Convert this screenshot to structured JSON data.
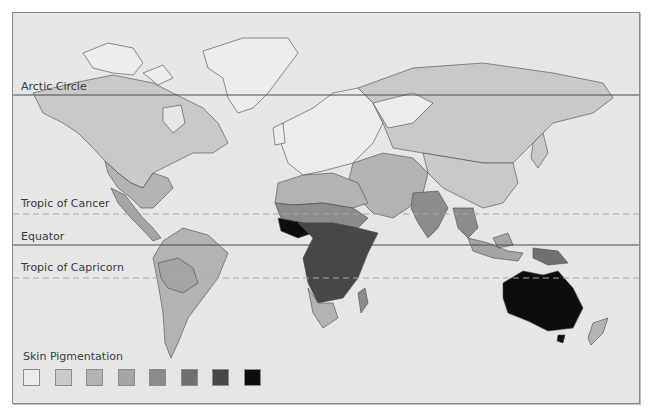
{
  "map": {
    "title": "Skin Pigmentation",
    "background": "#e6e6e6",
    "border_color": "#8a8a8a",
    "lines": [
      {
        "id": "arctic",
        "label": "Arctic Circle",
        "y": 82,
        "style": "solid"
      },
      {
        "id": "cancer",
        "label": "Tropic of Cancer",
        "y": 201,
        "style": "dashed"
      },
      {
        "id": "equator",
        "label": "Equator",
        "y": 232,
        "style": "solid"
      },
      {
        "id": "capricorn",
        "label": "Tropic of Capricorn",
        "y": 265,
        "style": "dashed"
      }
    ],
    "legend": {
      "title": "Skin Pigmentation",
      "levels": [
        {
          "level": 1,
          "color": "#ececec"
        },
        {
          "level": 2,
          "color": "#c9c9c9"
        },
        {
          "level": 3,
          "color": "#b3b3b3"
        },
        {
          "level": 4,
          "color": "#a5a5a5"
        },
        {
          "level": 5,
          "color": "#8c8c8c"
        },
        {
          "level": 6,
          "color": "#707070"
        },
        {
          "level": 7,
          "color": "#474747"
        },
        {
          "level": 8,
          "color": "#0d0d0d"
        }
      ]
    },
    "regions": [
      {
        "name": "Greenland",
        "level": 1
      },
      {
        "name": "Canadian Arctic",
        "level": 1
      },
      {
        "name": "North America north",
        "level": 2
      },
      {
        "name": "North America south",
        "level": 3
      },
      {
        "name": "Mexico",
        "level": 4
      },
      {
        "name": "Central America",
        "level": 4
      },
      {
        "name": "South America",
        "level": 3
      },
      {
        "name": "South America Andes",
        "level": 4
      },
      {
        "name": "Europe",
        "level": 1
      },
      {
        "name": "Russia",
        "level": 2
      },
      {
        "name": "Northern Africa",
        "level": 3
      },
      {
        "name": "Sahel",
        "level": 5
      },
      {
        "name": "Central Africa",
        "level": 7
      },
      {
        "name": "West Africa coast",
        "level": 8
      },
      {
        "name": "Southern Africa",
        "level": 3
      },
      {
        "name": "Madagascar",
        "level": 5
      },
      {
        "name": "Middle East",
        "level": 3
      },
      {
        "name": "Central Asia",
        "level": 2
      },
      {
        "name": "India",
        "level": 5
      },
      {
        "name": "Southeast Asia",
        "level": 5
      },
      {
        "name": "China",
        "level": 2
      },
      {
        "name": "Indonesia",
        "level": 4
      },
      {
        "name": "New Guinea",
        "level": 6
      },
      {
        "name": "Australia",
        "level": 8
      },
      {
        "name": "New Zealand",
        "level": 3
      }
    ]
  }
}
